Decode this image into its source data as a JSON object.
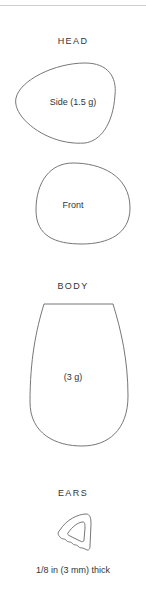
{
  "sections": {
    "head": {
      "heading": "HEAD",
      "side_label": "Side (1.5 g)",
      "front_label": "Front"
    },
    "body": {
      "heading": "BODY",
      "label": "(3 g)"
    },
    "ears": {
      "heading": "EARS",
      "label": "1/8 in (3 mm) thick"
    }
  },
  "colors": {
    "outline": "#777777",
    "text": "#333333",
    "rule": "#cfcfcf"
  }
}
